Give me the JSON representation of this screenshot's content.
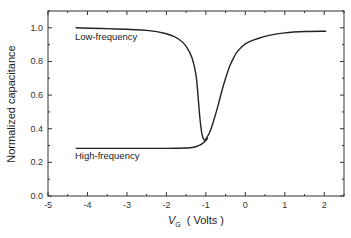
{
  "chart_data": {
    "type": "line",
    "title": "",
    "xlabel": "V_G ( Volts )",
    "xlabel_main": "V",
    "xlabel_sub": "G",
    "xlabel_unit": "( Volts )",
    "ylabel": "Normalized capacitance",
    "xlim": [
      -5,
      2.5
    ],
    "ylim": [
      0.0,
      1.1
    ],
    "xticks": [
      -5,
      -4,
      -3,
      -2,
      -1,
      0,
      1,
      2
    ],
    "xtick_labels": [
      "-5",
      "-4",
      "-3",
      "-2",
      "-1",
      "0",
      "1",
      "2"
    ],
    "yticks": [
      0.0,
      0.2,
      0.4,
      0.6,
      0.8,
      1.0
    ],
    "ytick_labels": [
      "0.0",
      "0.2",
      "0.4",
      "0.6",
      "0.8",
      "1.0"
    ],
    "grid": false,
    "legend": "none",
    "series": [
      {
        "name": "Low-frequency",
        "x": [
          -4.3,
          -3.5,
          -2.5,
          -2.0,
          -1.7,
          -1.5,
          -1.35,
          -1.25,
          -1.2,
          -1.15,
          -1.1,
          -1.05,
          -1.0,
          -0.9,
          -0.8,
          -0.7,
          -0.6,
          -0.5,
          -0.4,
          -0.3,
          -0.2,
          0.0,
          0.3,
          0.6,
          1.0,
          1.5,
          2.05
        ],
        "y": [
          1.0,
          0.995,
          0.985,
          0.965,
          0.935,
          0.89,
          0.82,
          0.72,
          0.6,
          0.46,
          0.37,
          0.335,
          0.34,
          0.38,
          0.45,
          0.53,
          0.62,
          0.7,
          0.77,
          0.82,
          0.86,
          0.905,
          0.935,
          0.955,
          0.97,
          0.978,
          0.98
        ]
      },
      {
        "name": "High-frequency",
        "x": [
          -4.3,
          -3.0,
          -2.0,
          -1.5,
          -1.3,
          -1.2,
          -1.1,
          -1.0,
          -0.95
        ],
        "y": [
          0.283,
          0.283,
          0.283,
          0.285,
          0.29,
          0.298,
          0.31,
          0.33,
          0.345
        ]
      }
    ],
    "annotations": [
      {
        "text": "Low-frequency",
        "x": -4.3,
        "y": 0.93
      },
      {
        "text": "High-frequency",
        "x": -4.3,
        "y": 0.21
      }
    ]
  },
  "labels": {
    "low_freq": "Low-frequency",
    "high_freq": "High-frequency",
    "ylabel": "Normalized capacitance",
    "xlabel_main": "V",
    "xlabel_sub": "G",
    "xlabel_unit": "( Volts )"
  }
}
